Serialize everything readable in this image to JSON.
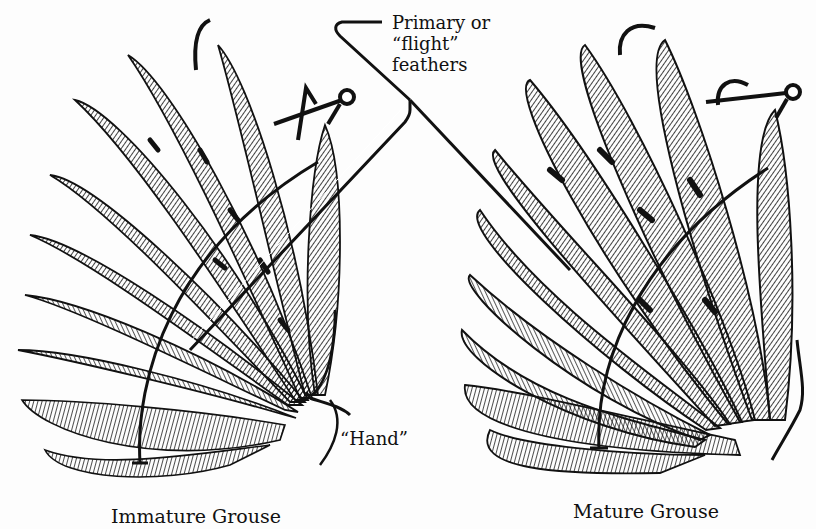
{
  "figure": {
    "background": "#fdfdfd",
    "ink": "#111111",
    "wings": [
      {
        "id": "immature",
        "caption": "Immature Grouse",
        "primary_tip_shape": "pointed",
        "markers": [
          "hook-mark",
          "caret-mark",
          "pin-circle"
        ]
      },
      {
        "id": "mature",
        "caption": "Mature Grouse",
        "primary_tip_shape": "rounded",
        "markers": [
          "arc-mark",
          "arc-mark",
          "pin-circle"
        ]
      }
    ],
    "callouts": {
      "primary_line1": "Primary or",
      "primary_line2": "“flight”",
      "primary_line3": "feathers",
      "hand": "“Hand”"
    }
  }
}
